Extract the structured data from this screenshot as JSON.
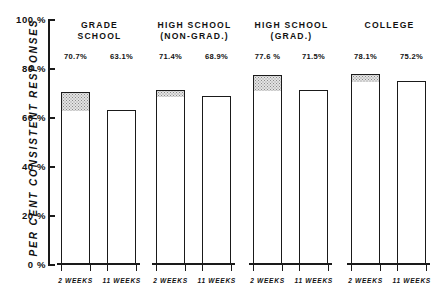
{
  "chart_data": {
    "type": "bar",
    "title": "",
    "xlabel": "",
    "ylabel": "PER CENT CONSISTENT RESPONSES",
    "ylim": [
      0,
      100
    ],
    "grid": false,
    "legend_position": "none",
    "y_ticks": [
      "0 %",
      "20 %",
      "40 %",
      "60 %",
      "80 %",
      "100 %"
    ],
    "y_tick_values": [
      0,
      20,
      40,
      60,
      80,
      100
    ],
    "categories": [
      "GRADE SCHOOL",
      "HIGH SCHOOL (NON-GRAD.)",
      "HIGH SCHOOL (GRAD.)",
      "COLLEGE"
    ],
    "series": [
      {
        "name": "2 WEEKS",
        "values": [
          70.7,
          71.4,
          77.6,
          78.1
        ]
      },
      {
        "name": "11 WEEKS",
        "values": [
          63.1,
          68.9,
          71.5,
          75.2
        ]
      }
    ],
    "annotations": "Each group's first bar carries a stippled band spanning from the 11-week value up to the 2-week value, marking the decline in consistent responses."
  },
  "y_axis": {
    "title": "PER CENT CONSISTENT RESPONSES",
    "ticks": [
      {
        "label": "100 %",
        "value": 100
      },
      {
        "label": "80 %",
        "value": 80
      },
      {
        "label": "60 %",
        "value": 60
      },
      {
        "label": "40 %",
        "value": 40
      },
      {
        "label": "20 %",
        "value": 20
      },
      {
        "label": "0 %",
        "value": 0
      }
    ]
  },
  "groups": [
    {
      "title_line1": "GRADE",
      "title_line2": "SCHOOL",
      "bars": [
        {
          "label": "2 WEEKS",
          "value": 70.7,
          "value_label": "70.7%",
          "shaded_from": 63.1
        },
        {
          "label": "11 WEEKS",
          "value": 63.1,
          "value_label": "63.1%",
          "shaded_from": null
        }
      ]
    },
    {
      "title_line1": "HIGH SCHOOL",
      "title_line2": "(NON-GRAD.)",
      "bars": [
        {
          "label": "2 WEEKS",
          "value": 71.4,
          "value_label": "71.4%",
          "shaded_from": 68.9
        },
        {
          "label": "11 WEEKS",
          "value": 68.9,
          "value_label": "68.9%",
          "shaded_from": null
        }
      ]
    },
    {
      "title_line1": "HIGH SCHOOL",
      "title_line2": "(GRAD.)",
      "bars": [
        {
          "label": "2 WEEKS",
          "value": 77.6,
          "value_label": "77.6 %",
          "shaded_from": 71.5
        },
        {
          "label": "11 WEEKS",
          "value": 71.5,
          "value_label": "71.5%",
          "shaded_from": null
        }
      ]
    },
    {
      "title_line1": "COLLEGE",
      "title_line2": "",
      "bars": [
        {
          "label": "2 WEEKS",
          "value": 78.1,
          "value_label": "78.1%",
          "shaded_from": 75.2
        },
        {
          "label": "11 WEEKS",
          "value": 75.2,
          "value_label": "75.2%",
          "shaded_from": null
        }
      ]
    }
  ],
  "colors": {
    "ink": "#1a1a1a",
    "paper": "#ffffff",
    "shade": "#e3e3e3"
  }
}
